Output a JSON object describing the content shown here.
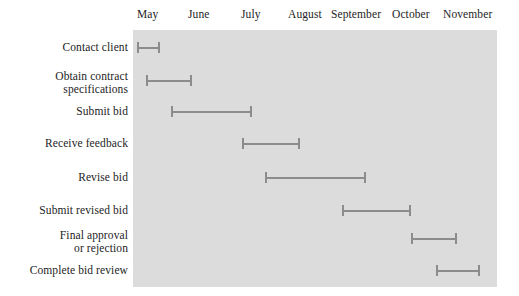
{
  "chart_data": {
    "type": "bar",
    "chart_subtype": "gantt",
    "title": "",
    "xlabel": "",
    "ylabel": "",
    "grid": false,
    "legend": null,
    "x_axis_position": "top",
    "x_tick_labels": [
      "May",
      "June",
      "July",
      "August",
      "September",
      "October",
      "November"
    ],
    "x_range": [
      "May",
      "November"
    ],
    "categories": [
      "Contact client",
      "Obtain contract\nspecifications",
      "Submit bid",
      "Receive feedback",
      "Revise bid",
      "Submit revised bid",
      "Final approval\nor rejection",
      "Complete bid review"
    ],
    "tasks": [
      {
        "label": "Contact client",
        "start_month": 5.0,
        "end_month": 5.45
      },
      {
        "label": "Obtain contract specifications",
        "start_month": 5.2,
        "end_month": 6.1
      },
      {
        "label": "Submit bid",
        "start_month": 5.7,
        "end_month": 7.3
      },
      {
        "label": "Receive feedback",
        "start_month": 7.1,
        "end_month": 8.3
      },
      {
        "label": "Revise bid",
        "start_month": 7.6,
        "end_month": 9.6
      },
      {
        "label": "Submit revised bid",
        "start_month": 9.2,
        "end_month": 10.6
      },
      {
        "label": "Final approval or rejection",
        "start_month": 10.6,
        "end_month": 11.5
      },
      {
        "label": "Complete bid review",
        "start_month": 11.1,
        "end_month": 12.0
      }
    ]
  },
  "axis": {
    "months": [
      {
        "label": "May",
        "x": 137
      },
      {
        "label": "June",
        "x": 188
      },
      {
        "label": "July",
        "x": 241
      },
      {
        "label": "August",
        "x": 288
      },
      {
        "label": "September",
        "x": 331
      },
      {
        "label": "October",
        "x": 392
      },
      {
        "label": "November",
        "x": 443
      }
    ]
  },
  "rows": [
    {
      "label": "Contact client",
      "label_y": 41,
      "bar_x": 137,
      "bar_w": 23,
      "bar_y": 42
    },
    {
      "label": "Obtain contract\nspecifications",
      "label_y": 70,
      "bar_x": 146,
      "bar_w": 46,
      "bar_y": 75
    },
    {
      "label": "Submit bid",
      "label_y": 105,
      "bar_x": 171,
      "bar_w": 81,
      "bar_y": 106
    },
    {
      "label": "Receive feedback",
      "label_y": 137,
      "bar_x": 242,
      "bar_w": 58,
      "bar_y": 138
    },
    {
      "label": "Revise bid",
      "label_y": 171,
      "bar_x": 265,
      "bar_w": 101,
      "bar_y": 172
    },
    {
      "label": "Submit revised bid",
      "label_y": 204,
      "bar_x": 342,
      "bar_w": 69,
      "bar_y": 205
    },
    {
      "label": "Final approval\nor rejection",
      "label_y": 229,
      "bar_x": 411,
      "bar_w": 46,
      "bar_y": 233
    },
    {
      "label": "Complete bid review",
      "label_y": 264,
      "bar_x": 436,
      "bar_w": 44,
      "bar_y": 265
    }
  ],
  "colors": {
    "plot_background": "#dcdcdc",
    "bar": "#8c8c8c",
    "text": "#242424",
    "page_background": "#ffffff"
  }
}
